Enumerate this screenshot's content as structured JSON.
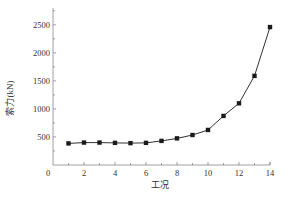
{
  "chart_data": {
    "type": "line",
    "title": "",
    "xlabel": "工况",
    "ylabel": "索力(kN)",
    "x": [
      1,
      2,
      3,
      4,
      5,
      6,
      7,
      8,
      9,
      10,
      11,
      12,
      13,
      14
    ],
    "series": [
      {
        "name": "索力",
        "values": [
          385,
          400,
          400,
          395,
          390,
          395,
          430,
          475,
          535,
          625,
          875,
          1100,
          1590,
          2460
        ],
        "marker": "square",
        "color": "#1a1a1a"
      }
    ],
    "xlim": [
      0,
      14
    ],
    "ylim": [
      0,
      2800
    ],
    "xticks": [
      0,
      2,
      4,
      6,
      8,
      10,
      12,
      14
    ],
    "yticks": [
      500,
      1000,
      1500,
      2000,
      2500
    ],
    "grid": false,
    "legend": null
  },
  "colors": {
    "axis": "#888888",
    "line": "#1a1a1a",
    "text": "#333333"
  }
}
